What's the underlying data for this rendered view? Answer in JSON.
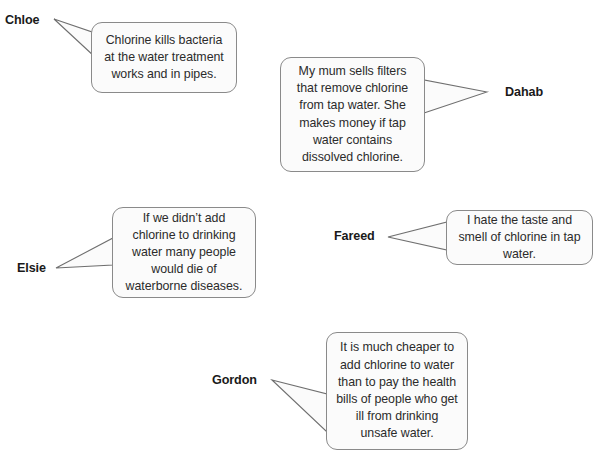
{
  "diagram": {
    "type": "speech-bubble-opinions",
    "topic": "Chlorination of drinking water",
    "background_color": "#ffffff",
    "bubble_fill": "#fbfbfb",
    "bubble_border_color": "#8a8a8a",
    "text_color": "#2b2b2b",
    "name_color": "#1a1a1a"
  },
  "speakers": [
    {
      "name": "Chloe",
      "quote": "Chlorine kills bacteria at the water treatment works and in pipes.",
      "name_position": "left-above",
      "tail_direction": "up-left"
    },
    {
      "name": "Dahab",
      "quote": "My mum sells filters that remove chlorine from tap water. She makes money if tap water contains dissolved chlorine.",
      "name_position": "right",
      "tail_direction": "right"
    },
    {
      "name": "Elsie",
      "quote": "If we didn’t add chlorine to drinking water many people would die of waterborne diseases.",
      "name_position": "left",
      "tail_direction": "left"
    },
    {
      "name": "Fareed",
      "quote": "I hate the taste and smell of chlorine in tap water.",
      "name_position": "left",
      "tail_direction": "left"
    },
    {
      "name": "Gordon",
      "quote": "It is much cheaper to add chlorine to water than to pay the health bills of people who get ill from drinking unsafe water.",
      "name_position": "left",
      "tail_direction": "left"
    }
  ]
}
